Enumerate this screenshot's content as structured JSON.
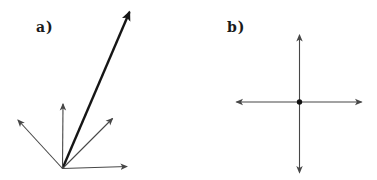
{
  "figure": {
    "background_color": "#ffffff",
    "thin_line_color": "#474747",
    "bold_line_color": "#161616",
    "dot_color": "#111111",
    "panels": [
      {
        "id": "a",
        "label": "a)",
        "origin": {
          "x": 62.5,
          "y": 168.5
        },
        "dot_radius": 0,
        "arrows": [
          {
            "name": "bold-long-vector-up-right",
            "x2": 129.5,
            "y2": 12,
            "width": 2.4,
            "bold": true
          },
          {
            "name": "vector-up",
            "x2": 63,
            "y2": 104,
            "width": 1.1,
            "bold": false
          },
          {
            "name": "vector-up-left",
            "x2": 18,
            "y2": 120,
            "width": 1.1,
            "bold": false
          },
          {
            "name": "vector-up-right",
            "x2": 112.5,
            "y2": 118.5,
            "width": 1.1,
            "bold": false
          },
          {
            "name": "vector-right",
            "x2": 127,
            "y2": 166.5,
            "width": 1.1,
            "bold": false
          }
        ]
      },
      {
        "id": "b",
        "label": "b)",
        "origin": {
          "x": 299.5,
          "y": 102
        },
        "dot_radius": 2.7,
        "arrows": [
          {
            "name": "axis-arrow-up",
            "x2": 299.5,
            "y2": 35,
            "width": 1.1,
            "bold": false
          },
          {
            "name": "axis-arrow-down",
            "x2": 299.5,
            "y2": 172.5,
            "width": 1.1,
            "bold": false
          },
          {
            "name": "axis-arrow-left",
            "x2": 236.5,
            "y2": 102,
            "width": 1.1,
            "bold": false
          },
          {
            "name": "axis-arrow-right",
            "x2": 361.5,
            "y2": 102,
            "width": 1.1,
            "bold": false
          }
        ]
      }
    ]
  }
}
